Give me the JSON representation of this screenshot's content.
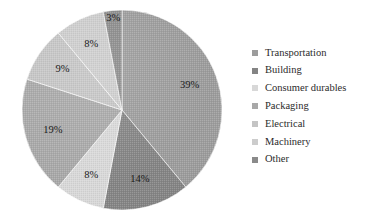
{
  "chart_data": {
    "type": "pie",
    "title": "",
    "categories": [
      "Transportation",
      "Building",
      "Consumer durables",
      "Packaging",
      "Electrical",
      "Machinery",
      "Other"
    ],
    "values": [
      39,
      14,
      8,
      19,
      9,
      8,
      3
    ],
    "labels": [
      "39%",
      "14%",
      "8%",
      "19%",
      "9%",
      "8%",
      "3%"
    ],
    "colors": [
      "#9c9c9c",
      "#848484",
      "#d8d8d8",
      "#a8a8a8",
      "#c4c4c4",
      "#cccccc",
      "#8a8a8a"
    ],
    "legend_position": "right",
    "start_angle_deg": 0,
    "direction": "clockwise",
    "grid": false,
    "xlabel": "",
    "ylabel": ""
  },
  "legend": {
    "items": [
      {
        "label": "Transportation",
        "color": "#9c9c9c"
      },
      {
        "label": "Building",
        "color": "#848484"
      },
      {
        "label": "Consumer durables",
        "color": "#d8d8d8"
      },
      {
        "label": "Packaging",
        "color": "#a8a8a8"
      },
      {
        "label": "Electrical",
        "color": "#c4c4c4"
      },
      {
        "label": "Machinery",
        "color": "#cccccc"
      },
      {
        "label": "Other",
        "color": "#8a8a8a"
      }
    ]
  }
}
